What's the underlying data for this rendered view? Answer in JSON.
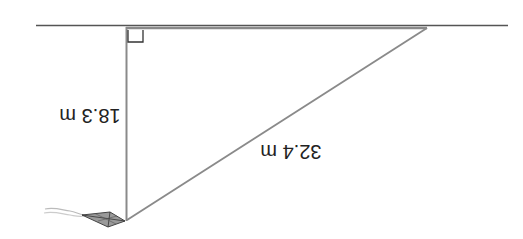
{
  "diagram": {
    "type": "right-triangle-kite",
    "orientation": "rotated-180",
    "labels": {
      "vertical_leg": "18.3 m",
      "hypotenuse": "32.4 m"
    },
    "elements": {
      "ground_line": "ground-line",
      "vertical_leg": "vertical-leg",
      "hypotenuse": "kite-string",
      "right_angle_marker": "right-angle-marker",
      "kite": "kite-icon"
    },
    "colors": {
      "line": "#8a8a8a",
      "ground": "#555555",
      "kite_fill": "#9a9a9a",
      "kite_stroke": "#444444",
      "tail": "#bbbbbb",
      "text": "#222222"
    }
  }
}
